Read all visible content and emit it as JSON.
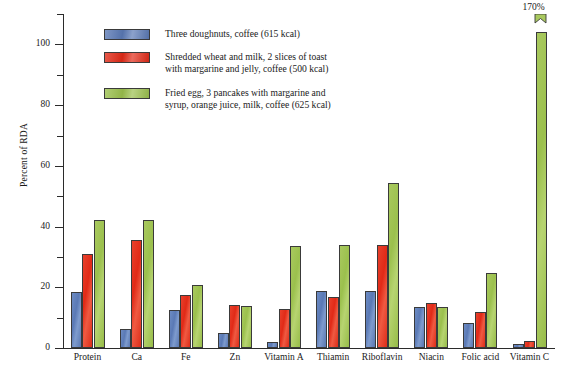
{
  "chart_data": {
    "type": "bar",
    "title": "",
    "xlabel": "",
    "ylabel": "Percent of RDA",
    "ylim": [
      0,
      110
    ],
    "ytick_step": 10,
    "ytick_labels": [
      "0",
      "20",
      "40",
      "60",
      "80",
      "100"
    ],
    "ytick_label_values": [
      0,
      20,
      40,
      60,
      80,
      100
    ],
    "grid": false,
    "legend_position": "upper-left-inside",
    "categories": [
      "Protein",
      "Ca",
      "Fe",
      "Zn",
      "Vitamin A",
      "Thiamin",
      "Riboflavin",
      "Niacin",
      "Folic acid",
      "Vitamin C"
    ],
    "series": [
      {
        "name": "Three doughnuts, coffee (615 kcal)",
        "color": "#5a79b5",
        "values": [
          18.3,
          6.2,
          12.6,
          5.0,
          2.0,
          18.8,
          18.8,
          13.6,
          8.3,
          1.2
        ]
      },
      {
        "name": "Shredded wheat and milk, 2 slices of toast with margarine and jelly, coffee (500 kcal)",
        "color": "#e12a17",
        "values": [
          31.0,
          35.5,
          17.4,
          14.1,
          12.8,
          16.9,
          33.8,
          15.0,
          11.8,
          2.3
        ]
      },
      {
        "name": "Fried egg, 3 pancakes with margarine and syrup, orange juice, milk, coffee (625 kcal)",
        "color": "#9bc04d",
        "values": [
          42.3,
          42.3,
          20.9,
          13.8,
          33.5,
          33.8,
          54.2,
          13.5,
          24.8,
          104.0
        ]
      }
    ],
    "annotations": [
      {
        "text": "170%",
        "category": "Vitamin C",
        "series": "Fried egg, 3 pancakes with margarine and syrup, orange juice, milk, coffee (625 kcal)",
        "actual_value": 170,
        "note": "bar is clipped / broken at top of axis"
      }
    ]
  },
  "legend": {
    "items": [
      {
        "label": "Three doughnuts, coffee (615 kcal)",
        "color": "#5a79b5",
        "swatch_name": "legend-swatch-blue"
      },
      {
        "label": "Shredded wheat and milk, 2 slices of toast\nwith margarine and jelly, coffee (500 kcal)",
        "color": "#e12a17",
        "swatch_name": "legend-swatch-red"
      },
      {
        "label": "Fried egg, 3 pancakes with margarine and\nsyrup, orange juice, milk, coffee (625 kcal)",
        "color": "#9bc04d",
        "swatch_name": "legend-swatch-green"
      }
    ]
  },
  "axes": {
    "y_title": "Percent of RDA",
    "y_labels": [
      "100",
      "80",
      "60",
      "40",
      "20",
      "0"
    ],
    "x_labels": [
      "Protein",
      "Ca",
      "Fe",
      "Zn",
      "Vitamin A",
      "Thiamin",
      "Riboflavin",
      "Niacin",
      "Folic acid",
      "Vitamin C"
    ]
  },
  "annotation": {
    "vitamin_c_label": "170%"
  }
}
